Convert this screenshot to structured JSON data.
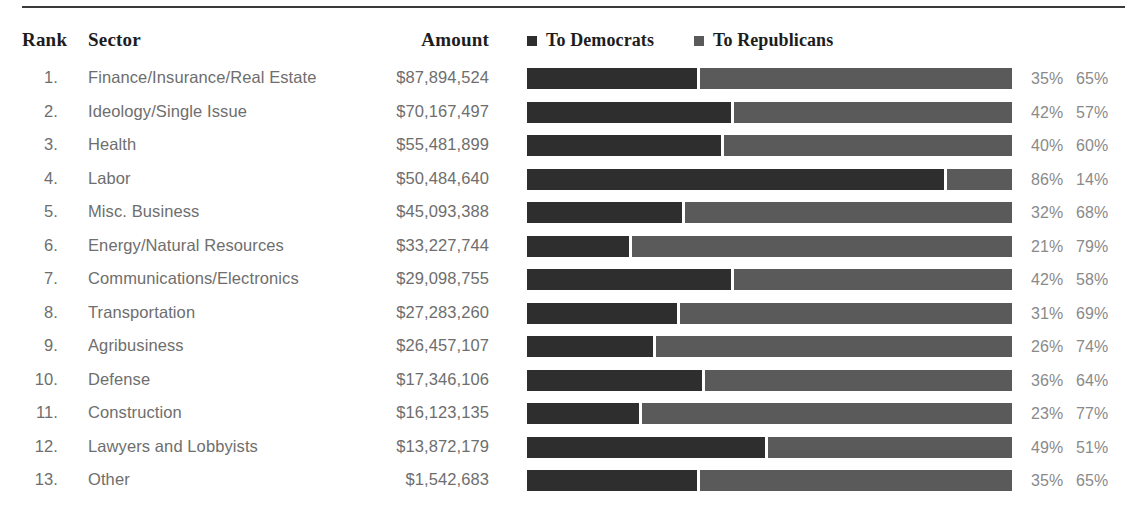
{
  "table": {
    "headers": {
      "rank": "Rank",
      "sector": "Sector",
      "amount": "Amount"
    },
    "rows": [
      {
        "rank": "1.",
        "sector": "Finance/Insurance/Real Estate",
        "amount": "$87,894,524",
        "dem_pct": 35,
        "rep_pct": 65,
        "dem_label": "35%",
        "rep_label": "65%"
      },
      {
        "rank": "2.",
        "sector": "Ideology/Single Issue",
        "amount": "$70,167,497",
        "dem_pct": 42,
        "rep_pct": 57,
        "dem_label": "42%",
        "rep_label": "57%"
      },
      {
        "rank": "3.",
        "sector": "Health",
        "amount": "$55,481,899",
        "dem_pct": 40,
        "rep_pct": 60,
        "dem_label": "40%",
        "rep_label": "60%"
      },
      {
        "rank": "4.",
        "sector": "Labor",
        "amount": "$50,484,640",
        "dem_pct": 86,
        "rep_pct": 14,
        "dem_label": "86%",
        "rep_label": "14%"
      },
      {
        "rank": "5.",
        "sector": "Misc. Business",
        "amount": "$45,093,388",
        "dem_pct": 32,
        "rep_pct": 68,
        "dem_label": "32%",
        "rep_label": "68%"
      },
      {
        "rank": "6.",
        "sector": "Energy/Natural Resources",
        "amount": "$33,227,744",
        "dem_pct": 21,
        "rep_pct": 79,
        "dem_label": "21%",
        "rep_label": "79%"
      },
      {
        "rank": "7.",
        "sector": "Communications/Electronics",
        "amount": "$29,098,755",
        "dem_pct": 42,
        "rep_pct": 58,
        "dem_label": "42%",
        "rep_label": "58%"
      },
      {
        "rank": "8.",
        "sector": "Transportation",
        "amount": "$27,283,260",
        "dem_pct": 31,
        "rep_pct": 69,
        "dem_label": "31%",
        "rep_label": "69%"
      },
      {
        "rank": "9.",
        "sector": "Agribusiness",
        "amount": "$26,457,107",
        "dem_pct": 26,
        "rep_pct": 74,
        "dem_label": "26%",
        "rep_label": "74%"
      },
      {
        "rank": "10.",
        "sector": "Defense",
        "amount": "$17,346,106",
        "dem_pct": 36,
        "rep_pct": 64,
        "dem_label": "36%",
        "rep_label": "64%"
      },
      {
        "rank": "11.",
        "sector": "Construction",
        "amount": "$16,123,135",
        "dem_pct": 23,
        "rep_pct": 77,
        "dem_label": "23%",
        "rep_label": "77%"
      },
      {
        "rank": "12.",
        "sector": "Lawyers and Lobbyists",
        "amount": "$13,872,179",
        "dem_pct": 49,
        "rep_pct": 51,
        "dem_label": "49%",
        "rep_label": "51%"
      },
      {
        "rank": "13.",
        "sector": "Other",
        "amount": "$1,542,683",
        "dem_pct": 35,
        "rep_pct": 65,
        "dem_label": "35%",
        "rep_label": "65%"
      }
    ]
  },
  "legend": {
    "items": [
      {
        "label": "To Democrats",
        "color": "#2e2e2e"
      },
      {
        "label": "To Republicans",
        "color": "#5a5a5a"
      }
    ]
  },
  "colors": {
    "democrat_bar": "#2e2e2e",
    "republican_bar": "#5a5a5a",
    "rule": "#3a3a3a",
    "header_text": "#1d1d1d",
    "body_text": "#6e6e6e",
    "pct_text": "#8a8a8a"
  },
  "chart_data": {
    "type": "bar",
    "title": "",
    "subtitle": "",
    "xlabel": "",
    "ylabel": "",
    "grid": false,
    "legend_position": "top-right",
    "stacked": true,
    "orientation": "horizontal",
    "xlim": [
      0,
      100
    ],
    "categories": [
      "Finance/Insurance/Real Estate",
      "Ideology/Single Issue",
      "Health",
      "Labor",
      "Misc. Business",
      "Energy/Natural Resources",
      "Communications/Electronics",
      "Transportation",
      "Agribusiness",
      "Defense",
      "Construction",
      "Lawyers and Lobbyists",
      "Other"
    ],
    "series": [
      {
        "name": "To Democrats",
        "color": "#2e2e2e",
        "values": [
          35,
          42,
          40,
          86,
          32,
          21,
          42,
          31,
          26,
          36,
          23,
          49,
          35
        ]
      },
      {
        "name": "To Republicans",
        "color": "#5a5a5a",
        "values": [
          65,
          57,
          60,
          14,
          68,
          79,
          58,
          69,
          74,
          64,
          77,
          51,
          65
        ]
      }
    ],
    "amounts": [
      87894524,
      70167497,
      55481899,
      50484640,
      45093388,
      33227744,
      29098755,
      27283260,
      26457107,
      17346106,
      16123135,
      13872179,
      1542683
    ],
    "amount_labels": [
      "$87,894,524",
      "$70,167,497",
      "$55,481,899",
      "$50,484,640",
      "$45,093,388",
      "$33,227,744",
      "$29,098,755",
      "$27,283,260",
      "$26,457,107",
      "$17,346,106",
      "$16,123,135",
      "$13,872,179",
      "$1,542,683"
    ],
    "ranks": [
      "1.",
      "2.",
      "3.",
      "4.",
      "5.",
      "6.",
      "7.",
      "8.",
      "9.",
      "10.",
      "11.",
      "12.",
      "13."
    ]
  }
}
